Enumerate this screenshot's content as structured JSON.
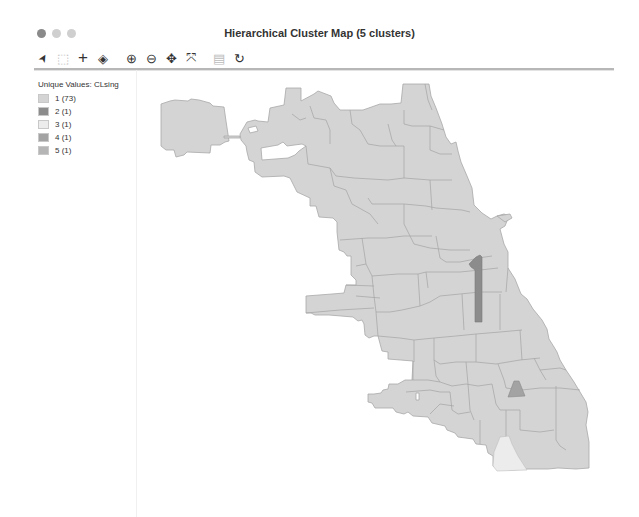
{
  "window": {
    "title": "Hierarchical Cluster Map (5 clusters)",
    "traffic_lights": [
      "close",
      "minimize",
      "zoom"
    ]
  },
  "toolbar": {
    "tools": [
      {
        "name": "select-tool",
        "glyph": "➤"
      },
      {
        "name": "select-rect-tool",
        "glyph": "⬚"
      },
      {
        "name": "add-tool",
        "glyph": "+"
      },
      {
        "name": "layers-tool",
        "glyph": "◈"
      },
      {
        "name": "zoom-in-tool",
        "glyph": "⊕"
      },
      {
        "name": "zoom-out-tool",
        "glyph": "⊖"
      },
      {
        "name": "pan-tool",
        "glyph": "✥"
      },
      {
        "name": "fit-extent-tool",
        "glyph": "⤧"
      },
      {
        "name": "save-tool",
        "glyph": "▤"
      },
      {
        "name": "refresh-tool",
        "glyph": "↻"
      }
    ]
  },
  "legend": {
    "title": "Unique Values: CLsing",
    "items": [
      {
        "label": "1 (73)",
        "color": "#d4d4d4"
      },
      {
        "label": "2 (1)",
        "color": "#8c8c8c"
      },
      {
        "label": "3 (1)",
        "color": "#ececec"
      },
      {
        "label": "4 (1)",
        "color": "#a3a3a3"
      },
      {
        "label": "5 (1)",
        "color": "#b5b5b5"
      }
    ]
  },
  "map": {
    "base_fill": "#d4d4d4",
    "border_color": "#a8a8a8",
    "cluster_fills": {
      "c2": "#8c8c8c",
      "c3": "#ececec",
      "c4": "#a3a3a3"
    }
  }
}
